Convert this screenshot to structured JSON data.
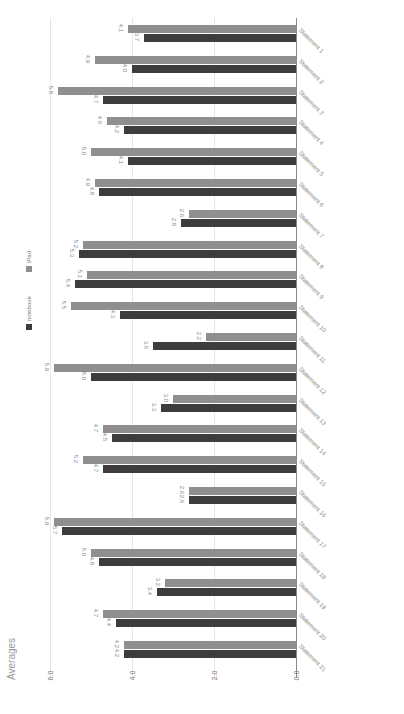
{
  "chart_data": {
    "type": "bar",
    "orientation": "horizontal, image rotated 90 degrees",
    "title": "",
    "ylabel": "Averages",
    "xlabel": "",
    "axis_ticks": [
      "0.0",
      "2.0",
      "4.0",
      "6.0"
    ],
    "ylim": [
      0,
      6
    ],
    "grid": true,
    "legend_position": "left",
    "categories": [
      "Statement 1",
      "Statement 2",
      "Statement 3",
      "Statement 4",
      "Statement 5",
      "Statement 6",
      "Statement 7",
      "Statement 8",
      "Statement 9",
      "Statement 10",
      "Statement 11",
      "Statement 12",
      "Statement 13",
      "Statement 14",
      "Statement 15",
      "Statement 16",
      "Statement 17",
      "Statement 18",
      "Statement 19",
      "Statement 20",
      "Statement 21"
    ],
    "series": [
      {
        "name": "iPad",
        "color": "#8f8f8f",
        "values": [
          4.1,
          4.9,
          5.8,
          4.6,
          5.0,
          4.9,
          2.6,
          5.2,
          5.1,
          5.5,
          2.2,
          5.9,
          3.0,
          4.7,
          5.2,
          2.6,
          5.9,
          5.0,
          3.2,
          4.7,
          4.2
        ]
      },
      {
        "name": "notebook",
        "color": "#3d3d3d",
        "values": [
          3.7,
          4.0,
          4.7,
          4.2,
          4.1,
          4.8,
          2.8,
          5.3,
          5.4,
          4.3,
          3.5,
          5.0,
          3.3,
          4.5,
          4.7,
          2.6,
          5.7,
          4.8,
          3.4,
          4.4,
          4.2
        ]
      }
    ]
  },
  "ui": {
    "ylabel": "Averages",
    "legend": [
      {
        "label": "notebook",
        "color": "#3d3d3d"
      },
      {
        "label": "iPad",
        "color": "#8f8f8f"
      }
    ]
  }
}
